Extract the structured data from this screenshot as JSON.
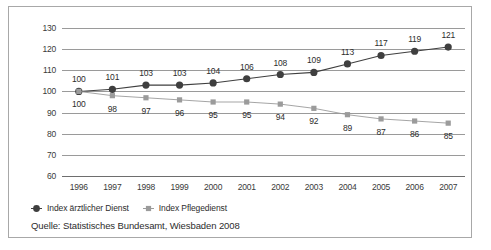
{
  "chart_data": {
    "type": "line",
    "title": "",
    "xlabel": "",
    "ylabel": "",
    "categories": [
      "1996",
      "1997",
      "1998",
      "1999",
      "2000",
      "2001",
      "2002",
      "2003",
      "2004",
      "2005",
      "2006",
      "2007"
    ],
    "ylim": [
      60,
      130
    ],
    "yticks": [
      60,
      70,
      80,
      90,
      100,
      110,
      120,
      130
    ],
    "grid": true,
    "legend_position": "bottom-left",
    "series": [
      {
        "name": "Index ärztlicher Dienst",
        "marker": "circle",
        "color": "#3f3f3f",
        "label_position": "above",
        "values": [
          100,
          101,
          103,
          103,
          104,
          106,
          108,
          109,
          113,
          117,
          119,
          121
        ]
      },
      {
        "name": "Index Pflegedienst",
        "marker": "square",
        "color": "#9b9b9b",
        "label_position": "below",
        "values": [
          100,
          98,
          97,
          96,
          95,
          95,
          94,
          92,
          89,
          87,
          86,
          85
        ]
      }
    ]
  },
  "source": {
    "text": "Quelle: Statistisches Bundesamt, Wiesbaden 2008"
  },
  "colors": {
    "series_1": "#3f3f3f",
    "series_2": "#9b9b9b",
    "grid": "#9a9a9a",
    "frame": "#a8a8a8",
    "background": "#ffffff",
    "text": "#2d2d2d"
  }
}
